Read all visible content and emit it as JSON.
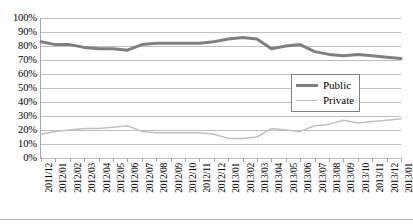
{
  "chart_data": {
    "type": "line",
    "title": "",
    "xlabel": "",
    "ylabel": "",
    "ylim": [
      0,
      100
    ],
    "y_unit": "%",
    "grid": true,
    "legend_position": "center-right",
    "y_ticks": [
      "100%",
      "90%",
      "80%",
      "70%",
      "60%",
      "50%",
      "40%",
      "30%",
      "20%",
      "10%",
      "0%"
    ],
    "y_tick_values": [
      100,
      90,
      80,
      70,
      60,
      50,
      40,
      30,
      20,
      10,
      0
    ],
    "categories": [
      "2011/12",
      "2012/01",
      "2012/02",
      "2012/03",
      "2012/04",
      "2012/05",
      "2012/06",
      "2012/07",
      "2012/08",
      "2012/09",
      "2012/10",
      "2012/11",
      "2012/12",
      "2013/01",
      "2013/02",
      "2013/03",
      "2013/04",
      "2013/05",
      "2013/06",
      "2013/07",
      "2013/08",
      "2013/09",
      "2013/10",
      "2013/11",
      "2013/12",
      "2013/01"
    ],
    "series": [
      {
        "name": "Public",
        "color": "#7f7f7f",
        "width": 3,
        "values": [
          83,
          81,
          81,
          79,
          78,
          78,
          77,
          81,
          82,
          82,
          82,
          82,
          83,
          85,
          86,
          85,
          78,
          80,
          81,
          76,
          74,
          73,
          74,
          73,
          72,
          71
        ]
      },
      {
        "name": "Private",
        "color": "#c0c0c0",
        "width": 1.5,
        "values": [
          17,
          19,
          20,
          21,
          21,
          22,
          23,
          19,
          18,
          18,
          18,
          18,
          17,
          14,
          14,
          15,
          21,
          20,
          19,
          23,
          24,
          27,
          25,
          26,
          27,
          28
        ]
      }
    ]
  },
  "legend": {
    "items": [
      {
        "label": "Public"
      },
      {
        "label": "Private"
      }
    ]
  }
}
